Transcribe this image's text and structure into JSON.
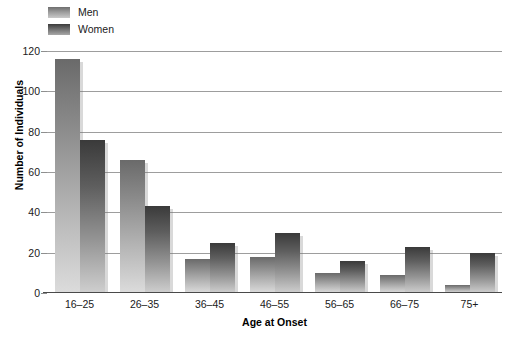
{
  "chart_data": {
    "type": "bar",
    "title": "",
    "subtitle": "",
    "xlabel": "Age at Onset",
    "ylabel": "Number of Individuals",
    "categories": [
      "16–25",
      "26–35",
      "36–45",
      "46–55",
      "56–65",
      "66–75",
      "75+"
    ],
    "series": [
      {
        "name": "Men",
        "values": [
          116,
          66,
          17,
          18,
          10,
          9,
          4
        ]
      },
      {
        "name": "Women",
        "values": [
          76,
          43,
          25,
          30,
          16,
          23,
          20
        ]
      }
    ],
    "ylim": [
      0,
      120
    ],
    "yticks": [
      0,
      20,
      40,
      60,
      80,
      100,
      120
    ],
    "ytick_labels": [
      "0",
      "20",
      "40",
      "60",
      "80",
      "100",
      "120"
    ],
    "grid": "horizontal",
    "legend_position": "top-left",
    "annotations": []
  },
  "legend": {
    "entries": [
      {
        "label": "Men",
        "swatch": "men-swatch",
        "color": "#8c8c8c"
      },
      {
        "label": "Women",
        "swatch": "women-swatch",
        "color": "#5e5e5e"
      }
    ]
  },
  "colors": {
    "men_top": "#6a6a6a",
    "men_bottom": "#dcdcdc",
    "women_top": "#3a3a3a",
    "women_bottom": "#cfcfcf",
    "gridline": "#9d9d9d",
    "axis": "#4a4a4a",
    "background": "#ffffff",
    "text": "#1a1a1a"
  }
}
